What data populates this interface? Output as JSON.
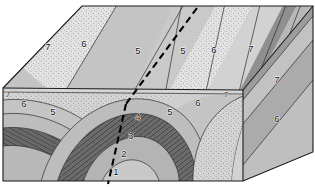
{
  "figure": {
    "kind": "geologic-block-diagram",
    "title": "Geologic block diagram of a faulted plunging anticline",
    "width": 315,
    "height": 187,
    "background_color": "#ffffff"
  },
  "structures": {
    "fold": "plunging anticline",
    "fault": "dashed strike-slip fault trace",
    "fault_style": "dashed"
  },
  "units": [
    {
      "id": "1",
      "label": "1",
      "fill": "#c8c8c8",
      "pattern": "plain",
      "position": "fold-core-innermost"
    },
    {
      "id": "2",
      "label": "2",
      "fill": "#b0b0b0",
      "pattern": "plain",
      "position": "fold-core"
    },
    {
      "id": "3",
      "label": "3",
      "fill": "#6e6e6e",
      "pattern": "hatched",
      "position": "fold-core-dark-band"
    },
    {
      "id": "4",
      "label": "4",
      "fill": "#bdbdbd",
      "pattern": "plain",
      "position": "fold-limb"
    },
    {
      "id": "5",
      "label": "5",
      "fill": "#c4c4c4",
      "pattern": "plain",
      "position": "middle-bed"
    },
    {
      "id": "6",
      "label": "6",
      "fill": "#e2e2e2",
      "pattern": "stippled",
      "position": "upper-bed"
    },
    {
      "id": "7",
      "label": "7",
      "fill": "#d2d2d2",
      "pattern": "plain",
      "position": "uppermost-bed"
    }
  ],
  "faces": {
    "top": {
      "name": "map-view top surface",
      "labels": [
        {
          "text": "7",
          "x": 48,
          "y": 47
        },
        {
          "text": "6",
          "x": 84,
          "y": 44
        },
        {
          "text": "5",
          "x": 138,
          "y": 51
        },
        {
          "text": "5",
          "x": 183,
          "y": 51
        },
        {
          "text": "6",
          "x": 214,
          "y": 50
        },
        {
          "text": "7",
          "x": 251,
          "y": 49
        }
      ]
    },
    "front": {
      "name": "front cross-section face",
      "labels": [
        {
          "text": "7",
          "x": 8,
          "y": 95,
          "small": true
        },
        {
          "text": "6",
          "x": 24,
          "y": 104
        },
        {
          "text": "5",
          "x": 53,
          "y": 112
        },
        {
          "text": "4",
          "x": 138,
          "y": 117
        },
        {
          "text": "3",
          "x": 131,
          "y": 136
        },
        {
          "text": "2",
          "x": 124,
          "y": 154
        },
        {
          "text": "1",
          "x": 116,
          "y": 172
        },
        {
          "text": "5",
          "x": 170,
          "y": 112
        },
        {
          "text": "6",
          "x": 198,
          "y": 103
        },
        {
          "text": "7",
          "x": 226,
          "y": 95,
          "small": true
        }
      ]
    },
    "right": {
      "name": "right side cross-section face",
      "labels": [
        {
          "text": "7",
          "x": 277,
          "y": 80
        },
        {
          "text": "6",
          "x": 277,
          "y": 119
        }
      ]
    }
  },
  "colors": {
    "outline": "#1a1a1a",
    "bed_line": "#2d2d2d",
    "fault": "#000000",
    "label_text": "#111111"
  }
}
